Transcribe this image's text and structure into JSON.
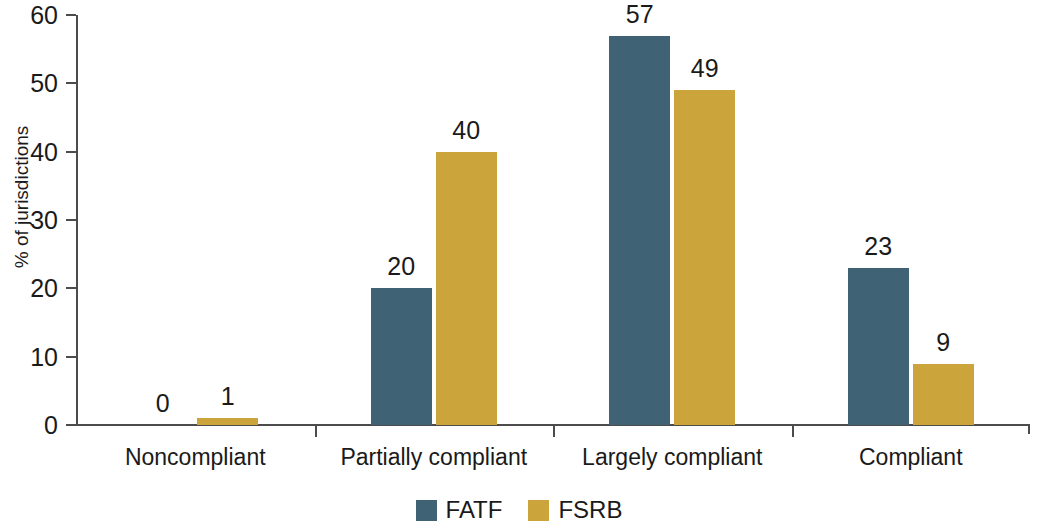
{
  "chart_data": {
    "type": "bar",
    "title": "",
    "subtitle": "",
    "xlabel": "",
    "ylabel": "% of jurisdictions",
    "ylim": [
      0,
      60
    ],
    "yticks": [
      0,
      10,
      20,
      30,
      40,
      50,
      60
    ],
    "ytick_labels": [
      "0",
      "10",
      "20",
      "30",
      "40",
      "50",
      "60"
    ],
    "grid": false,
    "legend_position": "bottom-center",
    "categories": [
      "Noncompliant",
      "Partially compliant",
      "Largely compliant",
      "Compliant"
    ],
    "series": [
      {
        "name": "FATF",
        "color": "#3f6275",
        "values": [
          0,
          20,
          57,
          23
        ],
        "labels": [
          "0",
          "20",
          "57",
          "23"
        ]
      },
      {
        "name": "FSRB",
        "color": "#cba53c",
        "values": [
          1,
          40,
          49,
          9
        ],
        "labels": [
          "1",
          "40",
          "49",
          "9"
        ]
      }
    ]
  },
  "legend": {
    "items": [
      {
        "label": "FATF",
        "color": "#3f6275"
      },
      {
        "label": "FSRB",
        "color": "#cba53c"
      }
    ]
  },
  "axis": {
    "y_title": "% of jurisdictions",
    "axis_color": "#4c4c4c",
    "text_color": "#1a1a1a"
  }
}
